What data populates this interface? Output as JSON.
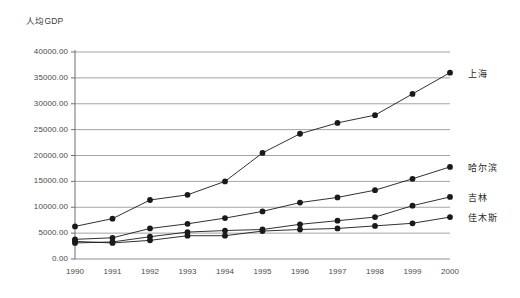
{
  "chart_data": {
    "type": "line",
    "title": "人均GDP",
    "xlabel": "",
    "ylabel": "人均GDP",
    "x": [
      1990,
      1991,
      1992,
      1993,
      1994,
      1995,
      1996,
      1997,
      1998,
      1999,
      2000
    ],
    "categories": [
      "1990",
      "1991",
      "1992",
      "1993",
      "1994",
      "1995",
      "1996",
      "1997",
      "1998",
      "1999",
      "2000"
    ],
    "ylim": [
      0,
      40000
    ],
    "ytick_values": [
      0,
      5000,
      10000,
      15000,
      20000,
      25000,
      30000,
      35000,
      40000
    ],
    "ytick_labels": [
      "0.00",
      "5000.00",
      "10000.00",
      "15000.00",
      "20000.00",
      "25000.00",
      "30000.00",
      "35000.00",
      "40000.00"
    ],
    "grid": true,
    "grid_axis": "y",
    "legend_position": "right-inline",
    "marker": "filled-circle",
    "series": [
      {
        "name": "上海",
        "color": "#1a1a1a",
        "values": [
          6300,
          7800,
          11400,
          12400,
          15000,
          20500,
          24200,
          26300,
          27800,
          31900,
          36000
        ]
      },
      {
        "name": "哈尔滨",
        "color": "#1a1a1a",
        "values": [
          3800,
          4100,
          5900,
          6800,
          7900,
          9200,
          10900,
          11900,
          13300,
          15500,
          17800
        ]
      },
      {
        "name": "吉林",
        "color": "#1a1a1a",
        "values": [
          3100,
          3300,
          4300,
          5200,
          5500,
          5700,
          6700,
          7400,
          8100,
          10300,
          12000
        ]
      },
      {
        "name": "佳木斯",
        "color": "#1a1a1a",
        "values": [
          3400,
          3100,
          3600,
          4500,
          4500,
          5400,
          5700,
          5900,
          6400,
          6900,
          8100
        ]
      }
    ]
  }
}
